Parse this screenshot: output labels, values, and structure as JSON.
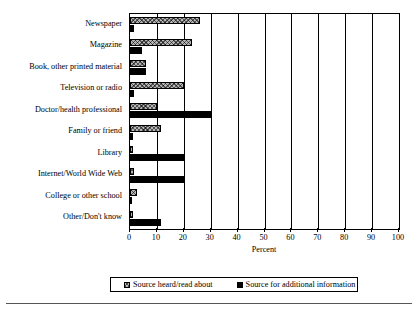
{
  "chart_data": {
    "type": "bar",
    "orientation": "horizontal",
    "title": "",
    "xlabel": "Percent",
    "ylabel": "",
    "xlim": [
      0,
      100
    ],
    "xticks": [
      0,
      10,
      20,
      30,
      40,
      50,
      60,
      70,
      80,
      90,
      100
    ],
    "grid": "vertical",
    "legend_position": "bottom",
    "categories": [
      "Newspaper",
      "Magazine",
      "Book, other printed material",
      "Television or radio",
      "Doctor/health professional",
      "Family or friend",
      "Library",
      "Internet/World Wide Web",
      "College or other school",
      "Other/Don't know"
    ],
    "series": [
      {
        "name": "Source heard/read about",
        "pattern": "hatched",
        "color": "#b5b5b5",
        "values": [
          26,
          23,
          6,
          20,
          10,
          11.5,
          0.3,
          1.5,
          2.5,
          0.3
        ]
      },
      {
        "name": "Source for additional information",
        "pattern": "solid",
        "color": "#000000",
        "values": [
          1.5,
          4.5,
          6,
          1.5,
          30,
          1,
          20.5,
          20,
          0.3,
          11.5
        ]
      }
    ]
  },
  "legend": {
    "items": [
      {
        "label": "Source heard/read about",
        "swatch": "hatched-square-icon"
      },
      {
        "label": "Source for additional information",
        "swatch": "filled-square-icon"
      }
    ]
  }
}
